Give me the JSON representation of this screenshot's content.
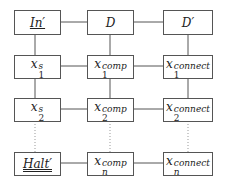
{
  "diagram": {
    "nodes": [
      {
        "id": "in",
        "label": "In′",
        "style": "underline",
        "row": 0,
        "col": 0
      },
      {
        "id": "d",
        "label": "D",
        "row": 0,
        "col": 1
      },
      {
        "id": "dp",
        "label": "D′",
        "row": 0,
        "col": 2
      },
      {
        "id": "x1s",
        "base": "x",
        "sup": "s",
        "sub": "1",
        "row": 1,
        "col": 0
      },
      {
        "id": "x1c",
        "base": "x",
        "sup": "comp",
        "sub": "1",
        "row": 1,
        "col": 1
      },
      {
        "id": "x1n",
        "base": "x",
        "sup": "connect",
        "sub": "1",
        "row": 1,
        "col": 2
      },
      {
        "id": "x2s",
        "base": "x",
        "sup": "s",
        "sub": "2",
        "row": 2,
        "col": 0
      },
      {
        "id": "x2c",
        "base": "x",
        "sup": "comp",
        "sub": "2",
        "row": 2,
        "col": 1
      },
      {
        "id": "x2n",
        "base": "x",
        "sup": "connect",
        "sub": "2",
        "row": 2,
        "col": 2
      },
      {
        "id": "halt",
        "label": "Halt′",
        "style": "double-underline",
        "row": 3,
        "col": 0
      },
      {
        "id": "xnc",
        "base": "x",
        "sup": "comp",
        "sub": "n",
        "row": 3,
        "col": 1
      },
      {
        "id": "xnn",
        "base": "x",
        "sup": "connect",
        "sub": "n",
        "row": 3,
        "col": 2
      }
    ],
    "edges_solid": [
      "in-d",
      "d-dp",
      "in-x1s",
      "d-x1c",
      "dp-x1n",
      "x1s-x1c",
      "x1c-x1n",
      "x1s-x2s",
      "x1c-x2c",
      "x1n-x2n",
      "x2s-x2c",
      "x2c-x2n",
      "halt-xnc",
      "xnc-xnn"
    ],
    "edges_dotted": [
      "x2s-halt",
      "x2c-xnc",
      "x2n-xnn"
    ]
  }
}
